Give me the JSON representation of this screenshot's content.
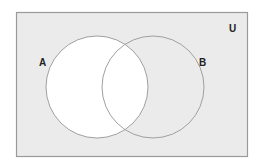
{
  "diagram": {
    "type": "venn",
    "universe": {
      "label": "U",
      "x": 16,
      "y": 12,
      "width": 231,
      "height": 144,
      "fill": "#ebebeb",
      "stroke": "#9a9a9a"
    },
    "sets": [
      {
        "label": "A",
        "cx": 97,
        "cy": 87,
        "r": 51,
        "fill": "#ffffff",
        "stroke": "#a0a0a0",
        "shaded": false
      },
      {
        "label": "B",
        "cx": 153,
        "cy": 87,
        "r": 51,
        "fill": "none",
        "stroke": "#a0a0a0",
        "shaded": true
      }
    ],
    "shaded_region": "U minus A (complement of A)",
    "colors": {
      "shaded": "#ebebeb",
      "unshaded": "#ffffff",
      "outline": "#9a9a9a",
      "text": "#222222"
    }
  }
}
